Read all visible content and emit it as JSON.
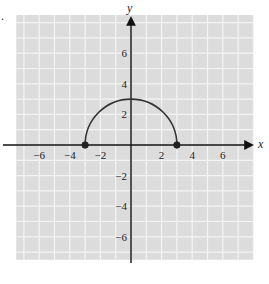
{
  "problem_marker": ".",
  "chart_data": {
    "type": "line",
    "title": "",
    "xlabel": "x",
    "ylabel": "y",
    "xlim": [
      -7.5,
      8
    ],
    "ylim": [
      -7.5,
      8.5
    ],
    "grid": true,
    "grid_step": 1,
    "x_ticks": [
      -6,
      -4,
      -2,
      2,
      4,
      6
    ],
    "y_ticks": [
      6,
      4,
      2,
      -2,
      -4,
      -6
    ],
    "x_tick_labels": [
      "−6",
      "−4",
      "−2",
      "2",
      "4",
      "6"
    ],
    "y_tick_labels": [
      "6",
      "4",
      "2",
      "−2",
      "−4",
      "−6"
    ],
    "series": [
      {
        "name": "upper semicircle",
        "equation": "y = sqrt(9 - x^2)",
        "shape": "semicircle",
        "center": [
          0,
          0
        ],
        "radius": 3,
        "x_range": [
          -3,
          3
        ],
        "color": "#333333"
      }
    ],
    "points": [
      {
        "x": -3,
        "y": 0,
        "filled": true
      },
      {
        "x": 3,
        "y": 0,
        "filled": true
      }
    ],
    "colors": {
      "grid_background": "#dcdcdc",
      "grid_lines": "#f4f4f4",
      "axes": "#111111",
      "curve": "#333333"
    }
  }
}
